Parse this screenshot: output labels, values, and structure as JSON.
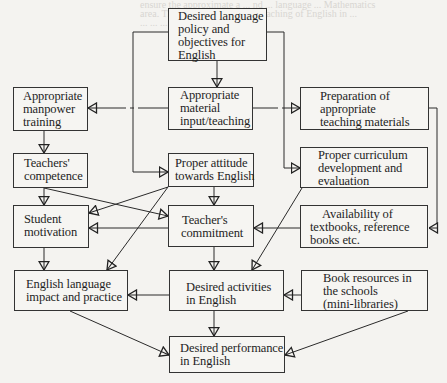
{
  "diagram": {
    "boxes": {
      "policy": {
        "lines": [
          "Desired language",
          "policy and",
          "objectives for",
          "English"
        ]
      },
      "manpower": {
        "lines": [
          "Appropriate",
          "manpower",
          "training"
        ]
      },
      "material": {
        "lines": [
          "Appropriate",
          "material",
          "input/teaching"
        ]
      },
      "preparation": {
        "lines": [
          "Preparation of",
          "appropriate",
          "teaching materials"
        ]
      },
      "competence": {
        "lines": [
          "Teachers'",
          "competence"
        ]
      },
      "attitude": {
        "lines": [
          "Proper attitude",
          "towards English"
        ]
      },
      "curriculum": {
        "lines": [
          "Proper curriculum",
          "development and",
          "evaluation"
        ]
      },
      "motivation": {
        "lines": [
          "Student",
          "motivation"
        ]
      },
      "commitment": {
        "lines": [
          "Teacher's",
          "commitment"
        ]
      },
      "availability": {
        "lines": [
          "Availability of",
          "textbooks, reference",
          "books etc."
        ]
      },
      "impact": {
        "lines": [
          "English language",
          "impact and practice"
        ]
      },
      "activities": {
        "lines": [
          "Desired activities",
          "in English"
        ]
      },
      "resources": {
        "lines": [
          "Book resources in",
          "the schools",
          "(mini-libraries)"
        ]
      },
      "performance": {
        "lines": [
          "Desired performance",
          "in English"
        ]
      }
    },
    "edges": [
      {
        "from": "policy",
        "to": "material"
      },
      {
        "from": "policy",
        "to": "attitude"
      },
      {
        "from": "policy",
        "to": "curriculum"
      },
      {
        "from": "material",
        "to": "manpower"
      },
      {
        "from": "material",
        "to": "preparation"
      },
      {
        "from": "preparation",
        "to": "availability"
      },
      {
        "from": "manpower",
        "to": "competence"
      },
      {
        "from": "competence",
        "to": "motivation"
      },
      {
        "from": "competence",
        "to": "commitment"
      },
      {
        "from": "attitude",
        "to": "commitment"
      },
      {
        "from": "attitude",
        "to": "motivation"
      },
      {
        "from": "attitude",
        "to": "impact"
      },
      {
        "from": "commitment",
        "to": "motivation"
      },
      {
        "from": "commitment",
        "to": "activities"
      },
      {
        "from": "availability",
        "to": "commitment"
      },
      {
        "from": "curriculum",
        "to": "activities"
      },
      {
        "from": "motivation",
        "to": "impact"
      },
      {
        "from": "activities",
        "to": "impact"
      },
      {
        "from": "resources",
        "to": "activities"
      },
      {
        "from": "activities",
        "to": "performance"
      },
      {
        "from": "impact",
        "to": "performance"
      },
      {
        "from": "resources",
        "to": "performance"
      }
    ]
  },
  "bleed_text": [
    "ensure the approximate a ... nd ... language ... Mathematics",
    "area. The chart is based on ... teaching of English in ...",
    "... ... ... ... ... ... Management ..."
  ]
}
